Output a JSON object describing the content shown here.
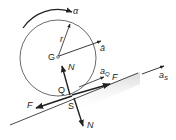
{
  "diagram": {
    "labels": {
      "alpha": "α",
      "radius": "r",
      "acceleration_g": "ā",
      "center": "G",
      "normal_top": "N",
      "contact_point_q": "Q",
      "contact_point_s": "S",
      "accel_q": "a",
      "accel_q_sub": "Q",
      "friction_right": "F",
      "friction_left": "F",
      "accel_s": "a",
      "accel_s_sub": "S",
      "normal_bottom": "N"
    },
    "colors": {
      "line": "#222222",
      "circle": "#444444",
      "shadow": "#d8d8d8"
    }
  }
}
